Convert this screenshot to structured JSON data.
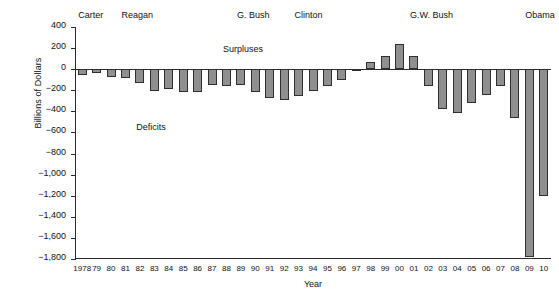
{
  "chart_data": {
    "type": "bar",
    "title": "",
    "xlabel": "Year",
    "ylabel": "Billions of Dollars",
    "ylim": [
      -1800,
      400
    ],
    "ytick_step": 200,
    "grid": false,
    "legend": "none",
    "yticks": [
      "400",
      "200",
      "0",
      "−200",
      "−400",
      "−600",
      "−800",
      "−1,000",
      "−1,200",
      "−1,400",
      "−1,600",
      "−1,800"
    ],
    "categories": [
      "1978",
      "79",
      "80",
      "81",
      "82",
      "83",
      "84",
      "85",
      "86",
      "87",
      "88",
      "89",
      "90",
      "91",
      "92",
      "93",
      "94",
      "95",
      "96",
      "97",
      "98",
      "99",
      "00",
      "01",
      "02",
      "03",
      "04",
      "05",
      "06",
      "07",
      "08",
      "09",
      "10"
    ],
    "values": [
      -59,
      -40,
      -74,
      -79,
      -128,
      -208,
      -185,
      -212,
      -221,
      -150,
      -155,
      -153,
      -221,
      -269,
      -290,
      -255,
      -203,
      -164,
      -107,
      -22,
      69,
      126,
      236,
      128,
      -158,
      -378,
      -413,
      -318,
      -248,
      -161,
      -459,
      -1780,
      -1200
    ],
    "bar_color": "#8f8f8f",
    "bar_edge_color": "#2f2f2f",
    "annotations": [
      {
        "text": "Surpluses",
        "x_category": "89",
        "y_value": 180
      },
      {
        "text": "Deficits",
        "x_category": "83",
        "y_value": -560
      }
    ],
    "group_labels": [
      {
        "label": "Carter",
        "start": "1978",
        "end": "80"
      },
      {
        "label": "Reagan",
        "start": "81",
        "end": "88"
      },
      {
        "label": "G. Bush",
        "start": "89",
        "end": "92"
      },
      {
        "label": "Clinton",
        "start": "93",
        "end": "00"
      },
      {
        "label": "G.W. Bush",
        "start": "01",
        "end": "08"
      },
      {
        "label": "Obama",
        "start": "09",
        "end": "10"
      }
    ]
  }
}
